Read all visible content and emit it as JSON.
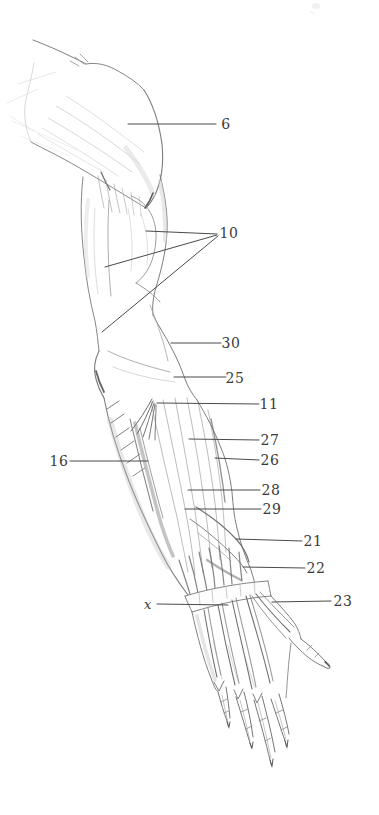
{
  "figure": {
    "paper_color": "#ffffff",
    "ink_color": "#3a3a3a",
    "leader_line_color": "#4a4a4a",
    "labels": [
      {
        "id": "6",
        "text": "6"
      },
      {
        "id": "10",
        "text": "10"
      },
      {
        "id": "30",
        "text": "30"
      },
      {
        "id": "25",
        "text": "25"
      },
      {
        "id": "11",
        "text": "11"
      },
      {
        "id": "27",
        "text": "27"
      },
      {
        "id": "26",
        "text": "26"
      },
      {
        "id": "16",
        "text": "16"
      },
      {
        "id": "28",
        "text": "28"
      },
      {
        "id": "29",
        "text": "29"
      },
      {
        "id": "21",
        "text": "21"
      },
      {
        "id": "22",
        "text": "22"
      },
      {
        "id": "x",
        "text": "x"
      },
      {
        "id": "23",
        "text": "23"
      }
    ]
  }
}
